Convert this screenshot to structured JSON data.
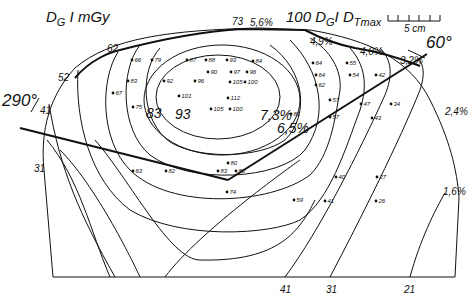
{
  "title": {
    "left": "D",
    "left_sub": "G",
    "left_unit": " I mGy",
    "right_prefix": "100 D",
    "right_sub": "G",
    "right_mid": "I D",
    "right_sub2": "Tmax"
  },
  "scale_bar": {
    "label": "5 cm"
  },
  "beam_angles": {
    "left": "290°",
    "right": "60°"
  },
  "boundary_labels": {
    "top_center": "73",
    "top_left": "62",
    "left_upper": "52",
    "left_mid": "41",
    "left_lower": "31",
    "bottom_1": "41",
    "bottom_2": "31",
    "bottom_3": "21"
  },
  "percent_labels": {
    "p56": "5,6%",
    "p49": "4,9%",
    "p40": "4,0%",
    "p32": "3,2%",
    "p24": "2,4%",
    "p16": "1,6%",
    "p73": "7,3%",
    "p65": "6,5%"
  },
  "contour_labels": {
    "c83": "83",
    "c93": "93"
  },
  "measurement_points": [
    {
      "v": "66",
      "x": 132,
      "y": 60
    },
    {
      "v": "79",
      "x": 152,
      "y": 60
    },
    {
      "v": "87",
      "x": 187,
      "y": 60
    },
    {
      "v": "88",
      "x": 206,
      "y": 60
    },
    {
      "v": "93",
      "x": 227,
      "y": 60
    },
    {
      "v": "84",
      "x": 253,
      "y": 61
    },
    {
      "v": "90",
      "x": 208,
      "y": 72
    },
    {
      "v": "97",
      "x": 231,
      "y": 72
    },
    {
      "v": "96",
      "x": 247,
      "y": 72
    },
    {
      "v": "83",
      "x": 128,
      "y": 81
    },
    {
      "v": "92",
      "x": 164,
      "y": 81
    },
    {
      "v": "96",
      "x": 195,
      "y": 81
    },
    {
      "v": "105",
      "x": 230,
      "y": 82
    },
    {
      "v": "100",
      "x": 245,
      "y": 82
    },
    {
      "v": "67",
      "x": 113,
      "y": 93
    },
    {
      "v": "101",
      "x": 179,
      "y": 96
    },
    {
      "v": "112",
      "x": 228,
      "y": 98
    },
    {
      "v": "105",
      "x": 211,
      "y": 109
    },
    {
      "v": "100",
      "x": 230,
      "y": 109
    },
    {
      "v": "75",
      "x": 133,
      "y": 107
    },
    {
      "v": "64",
      "x": 313,
      "y": 63
    },
    {
      "v": "55",
      "x": 347,
      "y": 63
    },
    {
      "v": "64",
      "x": 316,
      "y": 75
    },
    {
      "v": "54",
      "x": 350,
      "y": 75
    },
    {
      "v": "42",
      "x": 376,
      "y": 75
    },
    {
      "v": "62",
      "x": 316,
      "y": 85
    },
    {
      "v": "57",
      "x": 330,
      "y": 100
    },
    {
      "v": "81",
      "x": 291,
      "y": 114
    },
    {
      "v": "57",
      "x": 330,
      "y": 117
    },
    {
      "v": "47",
      "x": 361,
      "y": 104
    },
    {
      "v": "34",
      "x": 391,
      "y": 104
    },
    {
      "v": "43",
      "x": 372,
      "y": 118
    },
    {
      "v": "63",
      "x": 133,
      "y": 171
    },
    {
      "v": "82",
      "x": 166,
      "y": 171
    },
    {
      "v": "80",
      "x": 228,
      "y": 163
    },
    {
      "v": "83",
      "x": 218,
      "y": 171
    },
    {
      "v": "80",
      "x": 236,
      "y": 171
    },
    {
      "v": "74",
      "x": 227,
      "y": 192
    },
    {
      "v": "40",
      "x": 336,
      "y": 177
    },
    {
      "v": "27",
      "x": 377,
      "y": 177
    },
    {
      "v": "59",
      "x": 294,
      "y": 200
    },
    {
      "v": "41",
      "x": 325,
      "y": 201
    },
    {
      "v": "26",
      "x": 376,
      "y": 201
    }
  ],
  "colors": {
    "ink": "#111111",
    "paper": "#ffffff"
  }
}
